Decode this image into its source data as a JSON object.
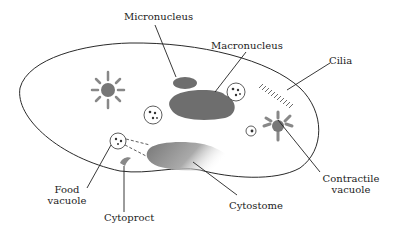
{
  "diagram": {
    "labels": {
      "micronucleus": "Micronucleus",
      "macronucleus": "Macronucleus",
      "cilia": "Cilia",
      "food_vacuole_line1": "Food",
      "food_vacuole_line2": "vacuole",
      "cytoproct": "Cytoproct",
      "cytostome": "Cytostome",
      "contractile_vacuole_line1": "Contractile",
      "contractile_vacuole_line2": "vacuole"
    },
    "colors": {
      "outline": "#2a2a2a",
      "organelle": "#6e6e6e",
      "background": "#ffffff"
    }
  }
}
